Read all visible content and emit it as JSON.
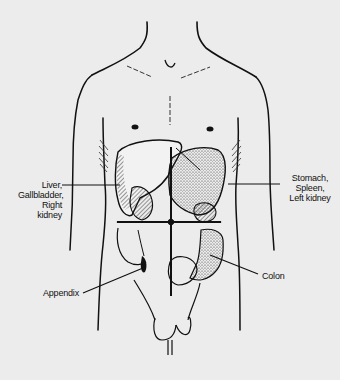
{
  "figure": {
    "quadrant_lines": "horizontal and vertical crosshair through umbilicus",
    "colors": {
      "background": "#ececec",
      "ink": "#111111"
    }
  },
  "labels": {
    "upper_right_quadrant": {
      "lines": [
        "Liver,",
        "Gallbladder,",
        "Right",
        "kidney"
      ]
    },
    "upper_left_quadrant": {
      "lines": [
        "Stomach,",
        "Spleen,",
        "Left kidney"
      ]
    },
    "appendix": "Appendix",
    "colon": "Colon"
  }
}
